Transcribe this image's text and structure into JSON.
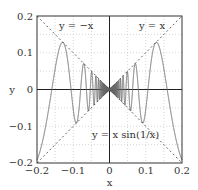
{
  "chart_data": {
    "type": "line",
    "title": "",
    "xlabel": "x",
    "ylabel": "y",
    "xlim": [
      -0.2,
      0.2
    ],
    "ylim": [
      -0.2,
      0.2
    ],
    "grid": true,
    "x_ticks": [
      "-0.2",
      "-0.1",
      "0",
      "0.1",
      "0.2"
    ],
    "y_ticks": [
      "0.2",
      "0.1",
      "0",
      "-0.1",
      "-0.2"
    ],
    "series": [
      {
        "name": "y = x sin(1/x)",
        "style": "solid",
        "function": "x*sin(1/x)"
      },
      {
        "name": "y = x",
        "style": "dashed",
        "function": "x"
      },
      {
        "name": "y = -x",
        "style": "dashed",
        "function": "-x"
      }
    ],
    "annotations": [
      {
        "text": "y = −x",
        "x": -0.1,
        "y": 0.17
      },
      {
        "text": "y = x",
        "x": 0.135,
        "y": 0.17
      },
      {
        "text": "y = x sin(1/x)",
        "x": 0.05,
        "y": -0.1
      }
    ]
  },
  "labels": {
    "xlabel": "x",
    "ylabel": "y",
    "xticks": [
      "−0.2",
      "−0.1",
      "0",
      "0.1",
      "0.2"
    ],
    "yticks": [
      "0.2",
      "0.1",
      "0",
      "−0.1",
      "−0.2"
    ],
    "annot_neg": "y = −x",
    "annot_pos": "y = x",
    "annot_curve": "y = x sin(1/x)"
  },
  "colors": {
    "curve": "#6a6a6a",
    "axis": "#333333",
    "grid": "#bbbbbb",
    "dash": "#555555"
  }
}
